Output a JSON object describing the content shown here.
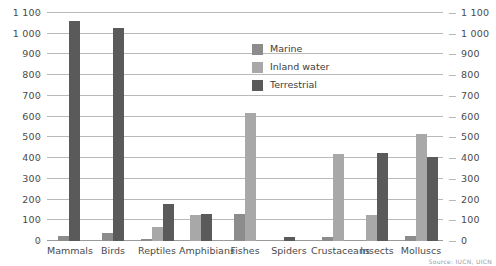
{
  "chart_data": {
    "type": "bar",
    "title": "",
    "subtitle": "",
    "xlabel": "",
    "ylabel": "",
    "ylim": [
      0,
      1100
    ],
    "ytick_step": 100,
    "grid": true,
    "dual_axis": true,
    "legend_position": "inside-top-center",
    "categories": [
      "Mammals",
      "Birds",
      "Reptiles",
      "Amphibians",
      "Fishes",
      "Spiders",
      "Crustaceans",
      "Insects",
      "Molluscs"
    ],
    "ytick_labels": [
      "0",
      "100",
      "200",
      "300",
      "400",
      "500",
      "600",
      "700",
      "800",
      "900",
      "1 000",
      "1 100"
    ],
    "ytick_values": [
      0,
      100,
      200,
      300,
      400,
      500,
      600,
      700,
      800,
      900,
      1000,
      1100
    ],
    "series": [
      {
        "name": "Marine",
        "color": "#8c8c8c",
        "values": [
          22,
          40,
          10,
          0,
          130,
          0,
          18,
          0,
          25
        ]
      },
      {
        "name": "Inland water",
        "color": "#a8a8a8",
        "values": [
          0,
          0,
          70,
          125,
          620,
          0,
          420,
          125,
          515
        ]
      },
      {
        "name": "Terrestrial",
        "color": "#5a5a5a",
        "values": [
          1060,
          1030,
          180,
          130,
          0,
          20,
          0,
          425,
          405
        ]
      }
    ],
    "source_text": "Source: IUCN, UICN"
  },
  "legend": {
    "items": [
      {
        "label": "Marine",
        "color": "#8c8c8c"
      },
      {
        "label": "Inland water",
        "color": "#a8a8a8"
      },
      {
        "label": "Terrestrial",
        "color": "#5a5a5a"
      }
    ]
  },
  "colors": {
    "marine": "#8c8c8c",
    "inland_water": "#a8a8a8",
    "terrestrial": "#5a5a5a",
    "gridline": "#b9b9b9",
    "text": "#4a4a4a",
    "background": "#ffffff"
  }
}
